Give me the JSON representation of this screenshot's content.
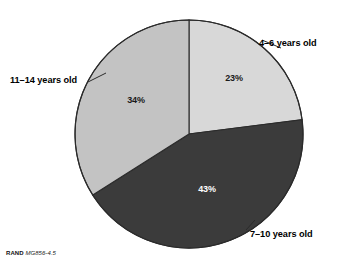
{
  "figure": {
    "background_color": "#ffffff",
    "footer": {
      "organization": "RAND",
      "document_id": "MG856-4.5"
    }
  },
  "chart_data": {
    "type": "pie",
    "title": "",
    "subtitle": "",
    "xlabel": "",
    "ylabel": "",
    "legend_position": "outside-labels",
    "grid": false,
    "start_angle_deg": 0,
    "direction": "clockwise",
    "categories": [
      "4–6 years old",
      "7–10 years old",
      "11–14 years old"
    ],
    "values": [
      23,
      43,
      34
    ],
    "value_labels": [
      "23%",
      "43%",
      "34%"
    ],
    "colors": [
      "#d8d8d8",
      "#3b3b3b",
      "#c3c3c3"
    ],
    "label_text_colors": [
      "#1a1a1a",
      "#ffffff",
      "#1a1a1a"
    ],
    "units": "percent",
    "total": 100,
    "slices": [
      {
        "category": "4–6 years old",
        "value": 23,
        "value_label": "23%",
        "color": "#d8d8d8",
        "start_angle_deg": 0,
        "end_angle_deg": 82.8
      },
      {
        "category": "7–10 years old",
        "value": 43,
        "value_label": "43%",
        "color": "#3b3b3b",
        "start_angle_deg": 82.8,
        "end_angle_deg": 237.6
      },
      {
        "category": "11–14 years old",
        "value": 34,
        "value_label": "34%",
        "color": "#c3c3c3",
        "start_angle_deg": 237.6,
        "end_angle_deg": 360
      }
    ]
  }
}
